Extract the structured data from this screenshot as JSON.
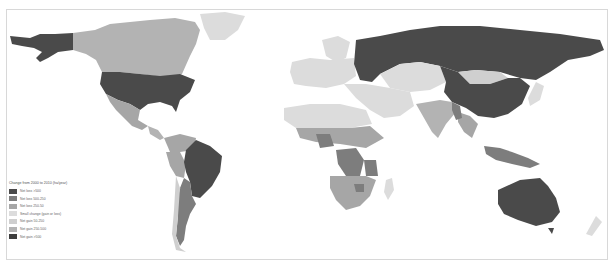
{
  "map": {
    "title": "Change from 2000 to 2010 (ha/year)",
    "legend": [
      {
        "label": "Net loss >500",
        "color": "#4a4a4a"
      },
      {
        "label": "Net loss 500-250",
        "color": "#7d7d7d"
      },
      {
        "label": "Net loss 250-50",
        "color": "#a6a6a6"
      },
      {
        "label": "Small change (gain or loss)",
        "color": "#dcdcdc"
      },
      {
        "label": "Net gain 50-250",
        "color": "#cfcfcf"
      },
      {
        "label": "Net gain 250-500",
        "color": "#b3b3b3"
      },
      {
        "label": "Net gain >500",
        "color": "#3e3e3e"
      }
    ],
    "regions": [
      {
        "name": "Alaska",
        "class": "Net gain >500"
      },
      {
        "name": "Canada",
        "class": "Net gain 250-500"
      },
      {
        "name": "United States",
        "class": "Net gain >500"
      },
      {
        "name": "Mexico",
        "class": "Net loss 250-50"
      },
      {
        "name": "Greenland",
        "class": "Small change (gain or loss)"
      },
      {
        "name": "Brazil",
        "class": "Net gain >500"
      },
      {
        "name": "Colombia",
        "class": "Net loss 250-50"
      },
      {
        "name": "Peru",
        "class": "Net loss 250-50"
      },
      {
        "name": "Argentina",
        "class": "Net loss 500-250"
      },
      {
        "name": "Chile",
        "class": "Net gain 50-250"
      },
      {
        "name": "Russia",
        "class": "Net gain >500"
      },
      {
        "name": "China",
        "class": "Net gain >500"
      },
      {
        "name": "Mongolia",
        "class": "Net gain 50-250"
      },
      {
        "name": "India",
        "class": "Net gain 250-500"
      },
      {
        "name": "Europe",
        "class": "Small change (gain or loss)"
      },
      {
        "name": "Middle East",
        "class": "Small change (gain or loss)"
      },
      {
        "name": "North Africa",
        "class": "Small change (gain or loss)"
      },
      {
        "name": "Sahel",
        "class": "Net loss 250-50"
      },
      {
        "name": "Nigeria",
        "class": "Net loss 500-250"
      },
      {
        "name": "DR Congo",
        "class": "Net loss 500-250"
      },
      {
        "name": "Tanzania",
        "class": "Net loss 500-250"
      },
      {
        "name": "Zimbabwe",
        "class": "Net loss 500-250"
      },
      {
        "name": "Southern Africa",
        "class": "Net loss 250-50"
      },
      {
        "name": "Madagascar",
        "class": "Small change (gain or loss)"
      },
      {
        "name": "Indonesia",
        "class": "Net loss 500-250"
      },
      {
        "name": "Southeast Asia",
        "class": "Net loss 250-50"
      },
      {
        "name": "Australia",
        "class": "Net gain >500"
      },
      {
        "name": "New Zealand",
        "class": "Small change (gain or loss)"
      }
    ]
  }
}
